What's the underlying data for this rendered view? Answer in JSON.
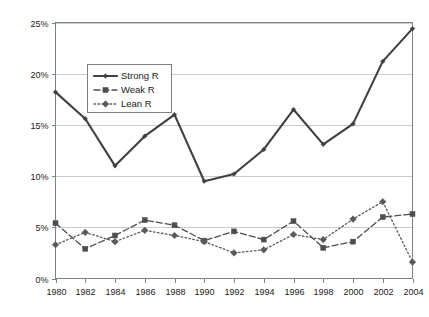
{
  "chart_data": {
    "type": "line",
    "title": "",
    "xlabel": "",
    "ylabel": "",
    "categories": [
      1980,
      1982,
      1984,
      1986,
      1988,
      1990,
      1992,
      1994,
      1996,
      1998,
      2000,
      2002,
      2004
    ],
    "xtick_labels": [
      "1980",
      "1982",
      "1984",
      "1986",
      "1988",
      "1990",
      "1992",
      "1994",
      "1996",
      "1998",
      "2000",
      "2002",
      "2004"
    ],
    "ytick_labels": [
      "0%",
      "5%",
      "10%",
      "15%",
      "20%",
      "25%"
    ],
    "ytick_values": [
      0,
      5,
      10,
      15,
      20,
      25
    ],
    "ylim": [
      0,
      25
    ],
    "xlim": [
      1980,
      2004
    ],
    "grid": true,
    "grid_axis": "y",
    "legend_position": "upper-left-inside",
    "series": [
      {
        "name": "Strong R",
        "style": "solid",
        "marker": "diamond",
        "color": "#404040",
        "values": [
          18.2,
          15.6,
          11.0,
          13.9,
          16.0,
          9.5,
          10.2,
          12.6,
          16.5,
          13.1,
          15.1,
          21.2,
          24.4
        ]
      },
      {
        "name": "Weak R",
        "style": "dashed",
        "marker": "square",
        "color": "#4d4d4d",
        "values": [
          5.4,
          2.9,
          4.2,
          5.7,
          5.2,
          3.7,
          4.6,
          3.8,
          5.6,
          3.0,
          3.6,
          6.0,
          6.3
        ]
      },
      {
        "name": "Lean R",
        "style": "dotted",
        "marker": "diamond",
        "color": "#595959",
        "values": [
          3.3,
          4.5,
          3.6,
          4.7,
          4.2,
          3.6,
          2.5,
          2.8,
          4.3,
          3.8,
          5.8,
          7.5,
          1.6
        ]
      }
    ]
  },
  "legend": {
    "items": [
      {
        "label": "Strong R"
      },
      {
        "label": "Weak R"
      },
      {
        "label": "Lean R"
      }
    ]
  },
  "axes": {
    "y": {
      "ticks": [
        {
          "label": "25%",
          "value": 25
        },
        {
          "label": "20%",
          "value": 20
        },
        {
          "label": "15%",
          "value": 15
        },
        {
          "label": "10%",
          "value": 10
        },
        {
          "label": "5%",
          "value": 5
        },
        {
          "label": "0%",
          "value": 0
        }
      ]
    },
    "x": {
      "ticks": [
        {
          "label": "1980"
        },
        {
          "label": "1982"
        },
        {
          "label": "1984"
        },
        {
          "label": "1986"
        },
        {
          "label": "1988"
        },
        {
          "label": "1990"
        },
        {
          "label": "1992"
        },
        {
          "label": "1994"
        },
        {
          "label": "1996"
        },
        {
          "label": "1998"
        },
        {
          "label": "2000"
        },
        {
          "label": "2002"
        },
        {
          "label": "2004"
        }
      ]
    }
  },
  "colors": {
    "plot_border": "#808080",
    "gridline": "#bfbfbf",
    "background": "#ffffff",
    "text": "#1a1a1a"
  }
}
